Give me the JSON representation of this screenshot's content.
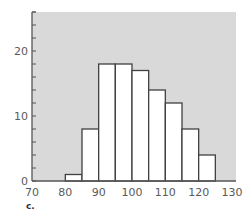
{
  "chart_data": {
    "type": "bar",
    "subtype": "histogram",
    "title": "",
    "xlabel": "",
    "ylabel": "",
    "bins": [
      [
        80,
        85
      ],
      [
        85,
        90
      ],
      [
        90,
        95
      ],
      [
        95,
        100
      ],
      [
        100,
        105
      ],
      [
        105,
        110
      ],
      [
        110,
        115
      ],
      [
        115,
        120
      ],
      [
        120,
        125
      ]
    ],
    "categories": [
      "80-85",
      "85-90",
      "90-95",
      "95-100",
      "100-105",
      "105-110",
      "110-115",
      "115-120",
      "120-125"
    ],
    "values": [
      1,
      8,
      18,
      18,
      17,
      14,
      12,
      8,
      4
    ],
    "xlim": [
      70,
      130
    ],
    "ylim": [
      0,
      26
    ],
    "x_ticks": [
      70,
      80,
      90,
      100,
      110,
      120,
      130
    ],
    "y_ticks": [
      0,
      10,
      20
    ],
    "y_minor_tick_step": 2,
    "grid": false,
    "legend": null,
    "colors": {
      "plot_background": "#d9d9d9",
      "bar_fill": "#ffffff",
      "bar_stroke": "#404040",
      "axis": "#555555"
    }
  },
  "panel_label": "c."
}
